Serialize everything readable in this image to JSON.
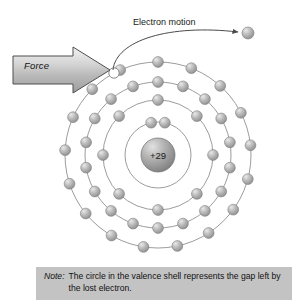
{
  "figure": {
    "type": "bohr-atom-model",
    "element_label": "+29",
    "nucleus_charge": 29,
    "element_name": "copper",
    "background_color": "#ffffff",
    "ink_color": "#7d7d7d",
    "electron_color": "#a8a8a8",
    "nucleus_color": "#9a9a9a"
  },
  "labels": {
    "electron_motion": "Electron motion",
    "force": "Force"
  },
  "note": {
    "label": "Note:",
    "text": "The circle in the valence shell represents the gap left by the lost electron.",
    "background_color": "#c3c3c3"
  },
  "chart_data": {
    "type": "scatter",
    "center": {
      "x": 158,
      "y": 155
    },
    "nucleus": {
      "radius": 17,
      "label": "+29"
    },
    "shells": [
      {
        "name": "shell-1",
        "radius": 33,
        "electron_count": 2,
        "angles": [
          -78,
          -102
        ]
      },
      {
        "name": "shell-2",
        "radius": 55,
        "electron_count": 8,
        "angles": [
          -90,
          -45,
          0,
          45,
          90,
          135,
          180,
          225
        ]
      },
      {
        "name": "shell-3",
        "radius": 73,
        "electron_count": 18,
        "angles": [
          -90,
          -70,
          -50,
          -30,
          -10,
          10,
          30,
          50,
          70,
          90,
          110,
          130,
          150,
          170,
          190,
          210,
          230,
          250
        ]
      },
      {
        "name": "shell-4-valence",
        "radius": 93,
        "electron_count": 17,
        "gap_angle": -118,
        "angles": [
          -90,
          -69,
          -48,
          -27,
          -6,
          15,
          36,
          57,
          78,
          99,
          120,
          141,
          162,
          183,
          204,
          225,
          246
        ]
      }
    ],
    "free_electron": {
      "x": 248,
      "y": 33,
      "radius": 6
    },
    "gap_marker": {
      "x": 114,
      "y": 73,
      "radius": 5,
      "filled": false
    },
    "force_arrow": {
      "x": 12,
      "y": 55,
      "width": 98,
      "height": 30,
      "direction": "right"
    },
    "motion_arrow": {
      "from": [
        114,
        73
      ],
      "to": [
        241,
        33
      ]
    },
    "xlabel": "",
    "ylabel": "",
    "grid": false,
    "legend": "none"
  }
}
